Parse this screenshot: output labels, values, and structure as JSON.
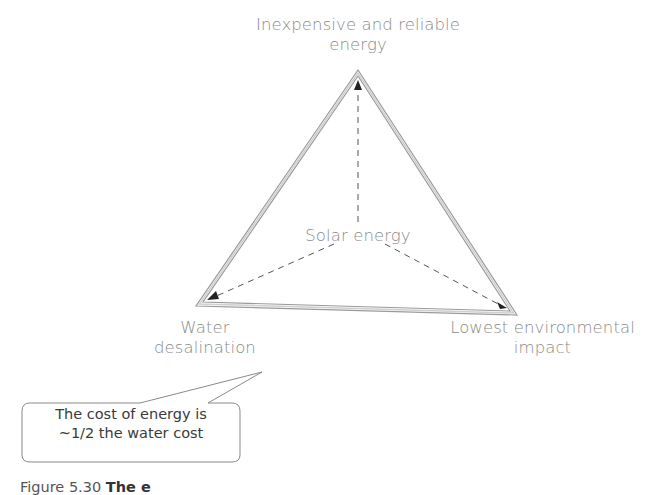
{
  "diagram": {
    "type": "triangle-trilemma",
    "center_label": "Solar energy",
    "vertices": [
      {
        "id": "top",
        "label_line1": "Inexpensive and reliable",
        "label_line2": "energy"
      },
      {
        "id": "bottom-left",
        "label_line1": "Water",
        "label_line2": "desalination"
      },
      {
        "id": "bottom-right",
        "label_line1": "Lowest environmental",
        "label_line2": "impact"
      }
    ],
    "callout": {
      "line1": "The cost of energy is",
      "line2": "~1/2 the water cost",
      "points_to": "bottom-left"
    }
  },
  "caption": {
    "prefix": "Figure 5.30",
    "text": "The e"
  }
}
